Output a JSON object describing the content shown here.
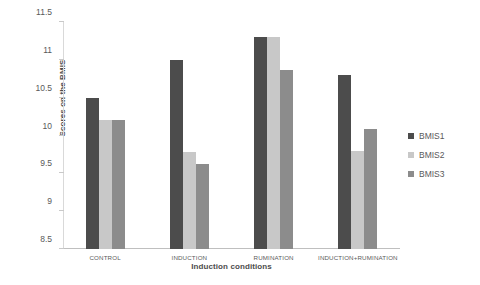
{
  "chart_data": {
    "type": "bar",
    "title": "",
    "xlabel": "Induction conditions",
    "ylabel": "Scores on the BMIS",
    "categories": [
      "CONTROL",
      "INDUCTION",
      "RUMINATION",
      "INDUCTION+RUMINATION"
    ],
    "series": [
      {
        "name": "BMIS1",
        "color": "#4c4c4c",
        "values": [
          10.5,
          11.0,
          11.3,
          10.8
        ]
      },
      {
        "name": "BMIS2",
        "color": "#c8c8c8",
        "values": [
          10.2,
          9.78,
          11.3,
          9.8
        ]
      },
      {
        "name": "BMIS3",
        "color": "#8c8c8c",
        "values": [
          10.2,
          9.63,
          10.87,
          10.08
        ]
      }
    ],
    "ylim": [
      8.5,
      11.5
    ],
    "yticks": [
      8.5,
      9,
      9.5,
      10,
      10.5,
      11,
      11.5
    ],
    "ytick_labels": [
      "8.5",
      "9",
      "9.5",
      "10",
      "10.5",
      "11",
      "11.5"
    ],
    "grid": false,
    "legend_position": "right",
    "legend_entries": [
      "BMIS1",
      "BMIS2",
      "BMIS3"
    ]
  }
}
